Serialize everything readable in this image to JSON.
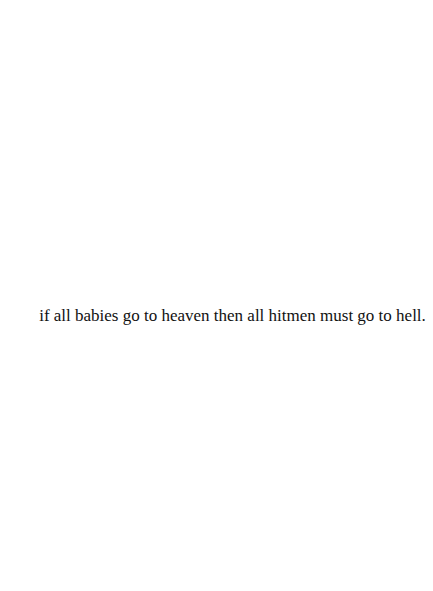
{
  "quote": {
    "text": "if all babies go to heaven then all hitmen must go to hell."
  },
  "colors": {
    "background": "#ffffff",
    "text": "#111111"
  }
}
